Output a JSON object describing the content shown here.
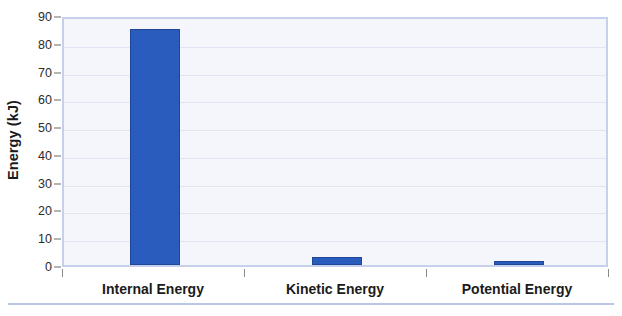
{
  "chart_data": {
    "type": "bar",
    "title": "",
    "subtitle": "",
    "xlabel": "",
    "ylabel": "Energy (kJ)",
    "categories": [
      "Internal Energy",
      "Kinetic Energy",
      "Potential Energy"
    ],
    "values": [
      85,
      3,
      1.3
    ],
    "series": [
      {
        "name": "Energy",
        "values": [
          85,
          3,
          1.3
        ],
        "color": "#2a5cbd"
      }
    ],
    "ylim": [
      0,
      90
    ],
    "ytick_labels": [
      "0",
      "10",
      "20",
      "30",
      "40",
      "50",
      "60",
      "70",
      "80",
      "90"
    ],
    "ytick_values": [
      0,
      10,
      20,
      30,
      40,
      50,
      60,
      70,
      80,
      90
    ],
    "grid": true,
    "grid_axis": "y",
    "legend": false,
    "legend_position": "none",
    "bar_color": "#2a5cbd",
    "bar_edge_color": "#1e4797",
    "plot_background": "#f4f6fb",
    "plot_border_color": "#c6d0ea",
    "grid_color": "#dfe5f2",
    "text_color": "#1b1b1b"
  }
}
